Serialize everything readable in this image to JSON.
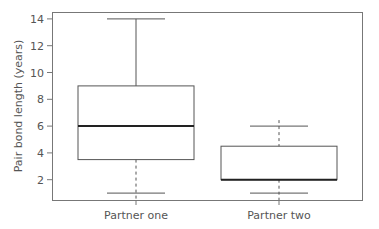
{
  "chart_data": {
    "type": "boxplot",
    "title": "",
    "xlabel": "",
    "ylabel": "Pair bond length (years)",
    "ylim": [
      0.5,
      14.5
    ],
    "yticks": [
      2,
      4,
      6,
      8,
      10,
      12,
      14
    ],
    "grid": false,
    "legend": null,
    "categories": [
      "Partner one",
      "Partner two"
    ],
    "series": [
      {
        "name": "Partner one",
        "whisker_low": 1,
        "q1": 3.5,
        "median": 6,
        "q3": 9,
        "whisker_high": 14
      },
      {
        "name": "Partner two",
        "whisker_low": 1,
        "q1": 2,
        "median": 2,
        "q3": 4.5,
        "whisker_high": 6
      }
    ]
  },
  "colors": {
    "line": "#555555",
    "median": "#222222",
    "axis_text": "#555555"
  }
}
